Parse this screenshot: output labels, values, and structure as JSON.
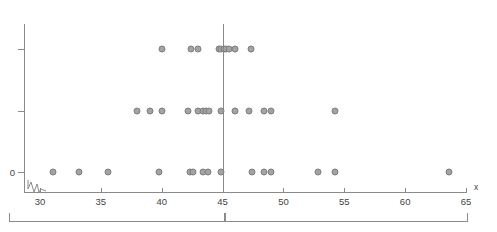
{
  "chart": {
    "type": "dotplot",
    "x_axis_name": "x",
    "y_axis_name": "",
    "y_tick_labels": [
      "0",
      "",
      ""
    ],
    "x_tick_labels": [
      "30",
      "35",
      "40",
      "45",
      "50",
      "55",
      "60",
      "65"
    ],
    "dot_color": "#a3a3a3",
    "dot_border_color": "#7d7d7d",
    "axis_color": "#8a8a8a",
    "median_marker_value": "45",
    "bracket_left_label": "",
    "bracket_right_label": ""
  },
  "chart_data": {
    "type": "scatter",
    "title": "",
    "subtitle": "",
    "xlabel": "x",
    "ylabel": "",
    "xlim": [
      29,
      65
    ],
    "ylim": [
      0,
      2
    ],
    "grid": false,
    "legend": "none",
    "axis_break_at_left": true,
    "x_ticks": [
      30,
      35,
      40,
      45,
      50,
      55,
      60,
      65
    ],
    "y_ticks": [
      0,
      1,
      2
    ],
    "y_tick_labels": [
      "0",
      "",
      ""
    ],
    "annotations": [
      {
        "type": "vline",
        "x": 45,
        "label": "45"
      },
      {
        "type": "bracket",
        "x_start": 29,
        "x_end": 45,
        "label": ""
      },
      {
        "type": "bracket",
        "x_start": 45,
        "x_end": 65,
        "label": ""
      }
    ],
    "series": [
      {
        "name": "row-0",
        "y": 0,
        "values": [
          31.1,
          33.2,
          35.6,
          39.8,
          42.3,
          42.6,
          43.4,
          43.8,
          44.9,
          47.4,
          48.4,
          49.0,
          52.8,
          54.2,
          63.6
        ]
      },
      {
        "name": "row-1",
        "y": 1,
        "values": [
          38.0,
          39.0,
          40.0,
          42.2,
          43.0,
          43.4,
          43.6,
          43.9,
          44.9,
          46.0,
          47.2,
          48.4,
          49.0,
          54.2
        ]
      },
      {
        "name": "row-2",
        "y": 2,
        "values": [
          40.0,
          42.4,
          43.0,
          44.7,
          44.9,
          45.1,
          45.3,
          45.5,
          46.0,
          47.3
        ]
      }
    ]
  }
}
